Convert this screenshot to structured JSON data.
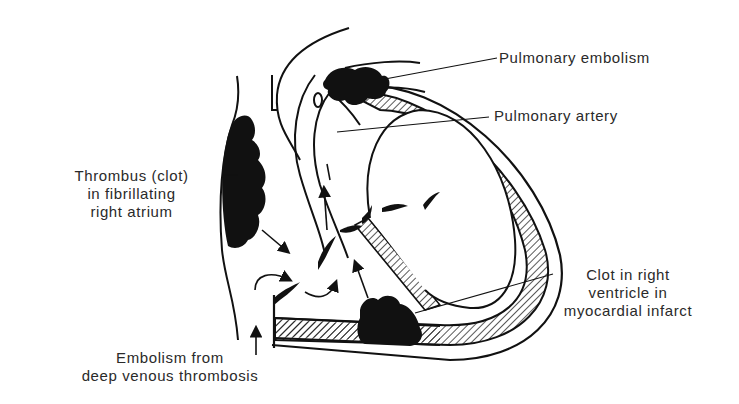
{
  "diagram": {
    "type": "anatomical-illustration",
    "colors": {
      "ink": "#111111",
      "text": "#2a2a2a",
      "background": "#ffffff",
      "clot_fill": "#111111"
    },
    "labels": {
      "pulmonary_embolism": "Pulmonary embolism",
      "pulmonary_artery": "Pulmonary artery",
      "thrombus_atrium": {
        "line1": "Thrombus (clot)",
        "line2": "in fibrillating",
        "line3": "right atrium"
      },
      "clot_ventricle": {
        "line1": "Clot in right",
        "line2": "ventricle in",
        "line3": "myocardial infarct"
      },
      "embolism_dvt": {
        "line1": "Embolism from",
        "line2": "deep venous thrombosis"
      }
    },
    "structures": [
      "pulmonary-artery",
      "right-atrium",
      "right-ventricle",
      "ventricular-septum",
      "myocardium-wall",
      "inferior-vena-cava",
      "valve-leaflets",
      "blood-flow-arrows"
    ]
  }
}
